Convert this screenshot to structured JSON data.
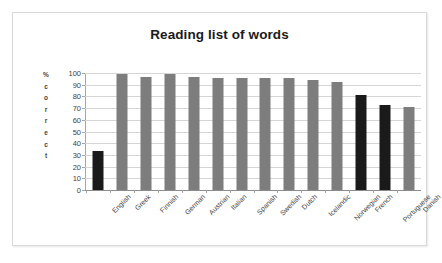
{
  "chart_data": {
    "type": "bar",
    "title": "Reading list of words",
    "xlabel": "",
    "ylabel": "% correct",
    "ylim": [
      0,
      100
    ],
    "yticks": [
      0,
      10,
      20,
      30,
      40,
      50,
      60,
      70,
      80,
      90,
      100
    ],
    "grid": true,
    "legend": false,
    "categories": [
      "English",
      "Greek",
      "Finnish",
      "German",
      "Austrian",
      "Italian",
      "Spanish",
      "Swedish",
      "Dutch",
      "Icelandic",
      "Norwegian",
      "French",
      "Portuguese",
      "Danish"
    ],
    "values": [
      33,
      99,
      97,
      99,
      97,
      96,
      96,
      96,
      96,
      94,
      92,
      81,
      73,
      71
    ],
    "bar_colors": [
      "#1a1a1a",
      "#7d7d7d",
      "#7d7d7d",
      "#7d7d7d",
      "#7d7d7d",
      "#7d7d7d",
      "#7d7d7d",
      "#7d7d7d",
      "#7d7d7d",
      "#7d7d7d",
      "#7d7d7d",
      "#1a1a1a",
      "#1a1a1a",
      "#7d7d7d"
    ],
    "colors": {
      "bar_gray": "#7d7d7d",
      "bar_black": "#1a1a1a",
      "gridline": "#d6d6d6",
      "axis": "#a6a6a6",
      "text": "#3f3f3f",
      "title": "#1a1a1a",
      "background": "#ffffff",
      "frame_border": "#d9d9d9"
    }
  },
  "axis_title_letters": [
    "%",
    "c",
    "o",
    "r",
    "r",
    "e",
    "c",
    "t"
  ]
}
